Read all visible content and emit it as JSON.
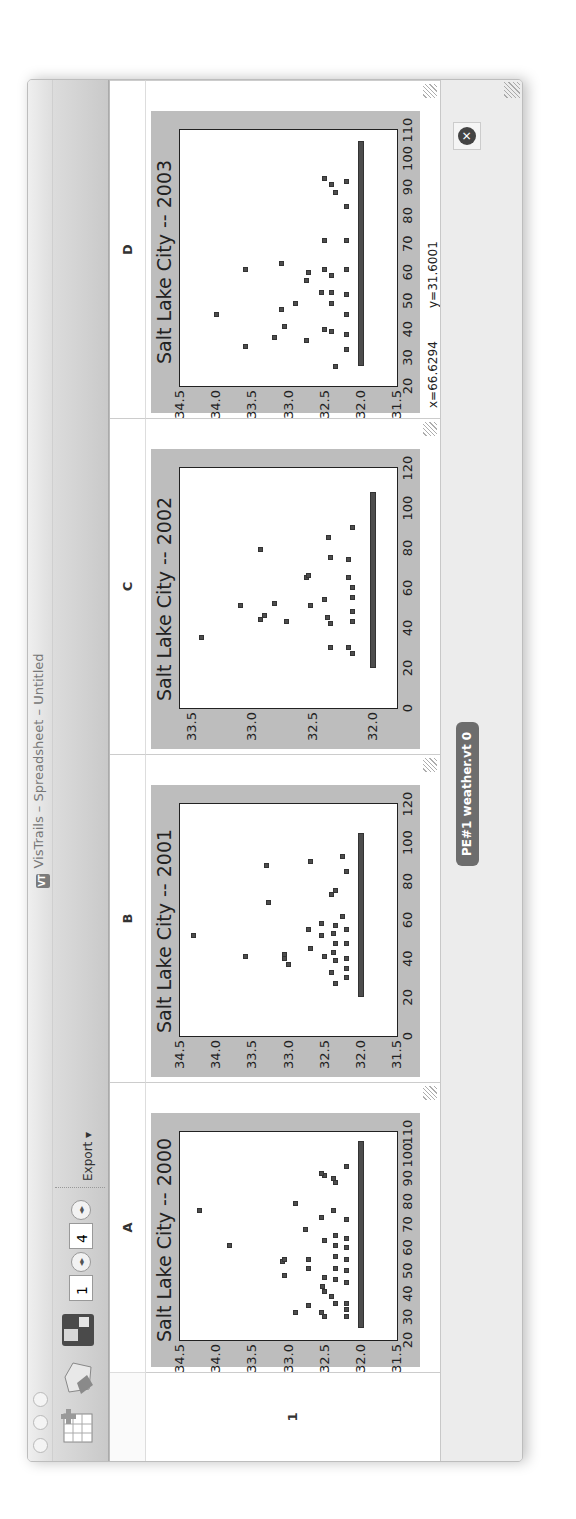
{
  "window": {
    "title": "VisTrails – Spreadsheet – Untitled",
    "app_icon": "VT"
  },
  "toolbar": {
    "new_sheet_icon": "grid-plus-icon",
    "open_icon": "open-folder-icon",
    "save_icon": "floppy-disk-icon",
    "rows_value": "1",
    "cols_value": "4",
    "export_label": "Export ▾"
  },
  "sheet": {
    "columns": [
      "A",
      "B",
      "C",
      "D"
    ],
    "rows": [
      "1"
    ]
  },
  "status": {
    "pipeline_tag": "PE#1 weather.vt 0",
    "coords": {
      "x": "x=66.6294",
      "y": "y=31.6001"
    }
  },
  "chart_data": [
    {
      "type": "scatter",
      "cell": "A1",
      "title": "Salt Lake City -- 2000",
      "xlabel": "",
      "ylabel": "",
      "xlim": [
        20,
        110
      ],
      "ylim": [
        31.5,
        34.5
      ],
      "xticks": [
        "20",
        "30",
        "40",
        "50",
        "60",
        "70",
        "80",
        "90",
        "100",
        "110"
      ],
      "yticks": [
        "31.5",
        "32.0",
        "32.5",
        "33.0",
        "33.5",
        "34.0",
        "34.5"
      ],
      "grid": false,
      "dense_band": {
        "y": 32.0,
        "x_from": 25,
        "x_to": 106
      },
      "points": [
        [
          76,
          34.23
        ],
        [
          61,
          33.81
        ],
        [
          48,
          33.05
        ],
        [
          54,
          33.08
        ],
        [
          55,
          33.05
        ],
        [
          32,
          32.9
        ],
        [
          79,
          32.9
        ],
        [
          35,
          32.72
        ],
        [
          51,
          32.72
        ],
        [
          55,
          32.72
        ],
        [
          68,
          32.76
        ],
        [
          30,
          32.5
        ],
        [
          32,
          32.55
        ],
        [
          41,
          32.5
        ],
        [
          43,
          32.53
        ],
        [
          47,
          32.5
        ],
        [
          63,
          32.5
        ],
        [
          73,
          32.55
        ],
        [
          91,
          32.5
        ],
        [
          92,
          32.55
        ],
        [
          36,
          32.35
        ],
        [
          39,
          32.4
        ],
        [
          46,
          32.35
        ],
        [
          51,
          32.35
        ],
        [
          56,
          32.35
        ],
        [
          61,
          32.35
        ],
        [
          65,
          32.35
        ],
        [
          76,
          32.38
        ],
        [
          88,
          32.35
        ],
        [
          90,
          32.38
        ],
        [
          30,
          32.2
        ],
        [
          33,
          32.2
        ],
        [
          36,
          32.2
        ],
        [
          45,
          32.2
        ],
        [
          50,
          32.2
        ],
        [
          55,
          32.2
        ],
        [
          60,
          32.2
        ],
        [
          64,
          32.2
        ],
        [
          72,
          32.2
        ],
        [
          95,
          32.2
        ]
      ]
    },
    {
      "type": "scatter",
      "cell": "B1",
      "title": "Salt Lake City -- 2001",
      "xlabel": "",
      "ylabel": "",
      "xlim": [
        0,
        120
      ],
      "ylim": [
        31.5,
        34.5
      ],
      "xticks": [
        "0",
        "20",
        "40",
        "60",
        "80",
        "100",
        "120"
      ],
      "yticks": [
        "31.5",
        "32.0",
        "32.5",
        "33.0",
        "33.5",
        "34.0",
        "34.5"
      ],
      "grid": false,
      "dense_band": {
        "y": 32.0,
        "x_from": 20,
        "x_to": 105
      },
      "points": [
        [
          52,
          34.32
        ],
        [
          41,
          33.6
        ],
        [
          88,
          33.3
        ],
        [
          69,
          33.27
        ],
        [
          37,
          33.0
        ],
        [
          40,
          33.05
        ],
        [
          42,
          33.05
        ],
        [
          45,
          32.7
        ],
        [
          55,
          32.72
        ],
        [
          90,
          32.7
        ],
        [
          41,
          32.5
        ],
        [
          52,
          32.55
        ],
        [
          58,
          32.55
        ],
        [
          27,
          32.35
        ],
        [
          33,
          32.4
        ],
        [
          39,
          32.35
        ],
        [
          43,
          32.38
        ],
        [
          48,
          32.35
        ],
        [
          53,
          32.38
        ],
        [
          57,
          32.35
        ],
        [
          73,
          32.4
        ],
        [
          75,
          32.35
        ],
        [
          30,
          32.2
        ],
        [
          35,
          32.2
        ],
        [
          40,
          32.2
        ],
        [
          48,
          32.2
        ],
        [
          55,
          32.2
        ],
        [
          62,
          32.25
        ],
        [
          85,
          32.2
        ],
        [
          93,
          32.25
        ]
      ]
    },
    {
      "type": "scatter",
      "cell": "C1",
      "title": "Salt Lake City -- 2002",
      "xlabel": "",
      "ylabel": "",
      "xlim": [
        0,
        120
      ],
      "ylim": [
        31.8,
        33.6
      ],
      "xticks": [
        "0",
        "20",
        "40",
        "60",
        "80",
        "100",
        "120"
      ],
      "yticks": [
        "32.0",
        "32.5",
        "33.0",
        "33.5"
      ],
      "grid": false,
      "dense_band": {
        "y": 32.0,
        "x_from": 20,
        "x_to": 108
      },
      "points": [
        [
          35,
          33.42
        ],
        [
          51,
          33.1
        ],
        [
          44,
          32.93
        ],
        [
          46,
          32.9
        ],
        [
          79,
          32.93
        ],
        [
          43,
          32.72
        ],
        [
          52,
          32.82
        ],
        [
          51,
          32.52
        ],
        [
          65,
          32.55
        ],
        [
          66,
          32.53
        ],
        [
          30,
          32.35
        ],
        [
          42,
          32.35
        ],
        [
          45,
          32.38
        ],
        [
          54,
          32.4
        ],
        [
          75,
          32.35
        ],
        [
          85,
          32.37
        ],
        [
          27,
          32.17
        ],
        [
          30,
          32.2
        ],
        [
          43,
          32.17
        ],
        [
          48,
          32.17
        ],
        [
          55,
          32.17
        ],
        [
          60,
          32.17
        ],
        [
          65,
          32.2
        ],
        [
          74,
          32.2
        ],
        [
          90,
          32.17
        ]
      ]
    },
    {
      "type": "scatter",
      "cell": "D1",
      "title": "Salt Lake City -- 2003",
      "xlabel": "",
      "ylabel": "",
      "xlim": [
        20,
        110
      ],
      "ylim": [
        31.5,
        34.5
      ],
      "xticks": [
        "20",
        "30",
        "40",
        "50",
        "60",
        "70",
        "80",
        "90",
        "100",
        "110"
      ],
      "yticks": [
        "31.5",
        "32.0",
        "32.5",
        "33.0",
        "33.5",
        "34.0",
        "34.5"
      ],
      "grid": false,
      "dense_band": {
        "y": 32.0,
        "x_from": 27,
        "x_to": 106
      },
      "points": [
        [
          45,
          34.0
        ],
        [
          34,
          33.6
        ],
        [
          61,
          33.6
        ],
        [
          37,
          33.2
        ],
        [
          41,
          33.05
        ],
        [
          47,
          33.1
        ],
        [
          49,
          32.9
        ],
        [
          63,
          33.1
        ],
        [
          36,
          32.75
        ],
        [
          57,
          32.75
        ],
        [
          60,
          32.72
        ],
        [
          40,
          32.5
        ],
        [
          53,
          32.55
        ],
        [
          61,
          32.5
        ],
        [
          71,
          32.5
        ],
        [
          93,
          32.5
        ],
        [
          27,
          32.35
        ],
        [
          39,
          32.4
        ],
        [
          49,
          32.4
        ],
        [
          53,
          32.4
        ],
        [
          59,
          32.4
        ],
        [
          88,
          32.35
        ],
        [
          91,
          32.4
        ],
        [
          33,
          32.2
        ],
        [
          38,
          32.2
        ],
        [
          45,
          32.2
        ],
        [
          52,
          32.2
        ],
        [
          61,
          32.2
        ],
        [
          71,
          32.2
        ],
        [
          83,
          32.2
        ],
        [
          92,
          32.2
        ]
      ]
    }
  ]
}
